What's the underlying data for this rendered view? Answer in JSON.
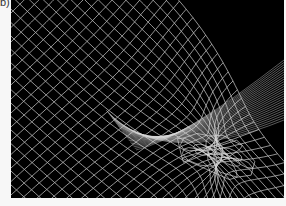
{
  "figure": {
    "panel_label": "b)",
    "background": "#000000",
    "line_color": "#d9d9d9"
  }
}
